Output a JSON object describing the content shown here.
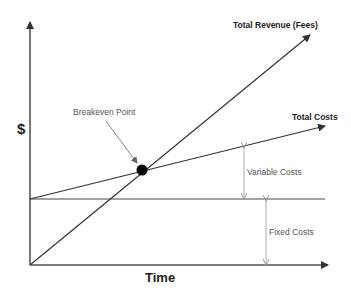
{
  "diagram": {
    "axes": {
      "y_label": "$",
      "x_label": "Time"
    },
    "lines": [
      {
        "name": "Total Revenue (Fees)",
        "from": [
          30,
          265
        ],
        "to": [
          310,
          35
        ]
      },
      {
        "name": "Total Costs",
        "from": [
          30,
          199
        ],
        "to": [
          325,
          126
        ]
      },
      {
        "name": "Fixed Costs Level",
        "from": [
          30,
          199
        ],
        "to": [
          325,
          199
        ]
      }
    ],
    "labels": {
      "revenue": "Total Revenue (Fees)",
      "total_costs": "Total Costs",
      "breakeven": "Breakeven Point",
      "variable_costs": "Variable Costs",
      "fixed_costs": "Fixed Costs"
    },
    "breakeven_point": [
      142,
      170
    ],
    "colors": {
      "line": "#333333",
      "dim_arrow": "#999999",
      "point": "#000000"
    }
  }
}
